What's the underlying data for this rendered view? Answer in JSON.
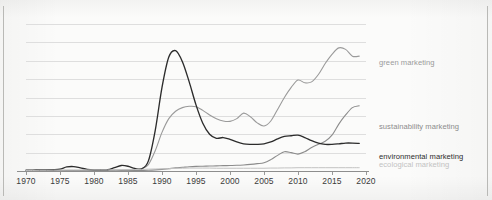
{
  "chart_data": {
    "type": "line",
    "title": "",
    "subtitle": "",
    "xlabel": "",
    "ylabel": "",
    "xlim": [
      1970,
      2020
    ],
    "ylim": [
      0,
      8
    ],
    "grid": true,
    "gridline_count": 8,
    "legend_position": "right-inline",
    "xticks": [
      "1970",
      "1975",
      "1980",
      "1985",
      "1990",
      "1995",
      "2000",
      "2005",
      "2010",
      "2015",
      "2020"
    ],
    "x": [
      1970,
      1971,
      1972,
      1973,
      1974,
      1975,
      1976,
      1977,
      1978,
      1979,
      1980,
      1981,
      1982,
      1983,
      1984,
      1985,
      1986,
      1987,
      1988,
      1989,
      1990,
      1991,
      1992,
      1993,
      1994,
      1995,
      1996,
      1997,
      1998,
      1999,
      2000,
      2001,
      2002,
      2003,
      2004,
      2005,
      2006,
      2007,
      2008,
      2009,
      2010,
      2011,
      2012,
      2013,
      2014,
      2015,
      2016,
      2017,
      2018,
      2019
    ],
    "series": [
      {
        "name": "green marketing",
        "label": "green marketing",
        "color": "#9a9a9a",
        "values": [
          0.02,
          0.02,
          0.02,
          0.02,
          0.02,
          0.02,
          0.03,
          0.03,
          0.03,
          0.03,
          0.03,
          0.04,
          0.04,
          0.05,
          0.05,
          0.06,
          0.08,
          0.12,
          0.35,
          1.1,
          2.1,
          2.85,
          3.25,
          3.45,
          3.52,
          3.5,
          3.3,
          3.05,
          2.85,
          2.72,
          2.7,
          2.85,
          3.15,
          2.95,
          2.62,
          2.45,
          2.72,
          3.35,
          4.0,
          4.55,
          4.95,
          4.8,
          4.85,
          5.25,
          5.85,
          6.35,
          6.7,
          6.62,
          6.25,
          6.25
        ]
      },
      {
        "name": "sustainability marketing",
        "label": "sustainability marketing",
        "color": "#8c8c8c",
        "values": [
          0.01,
          0.01,
          0.01,
          0.01,
          0.01,
          0.01,
          0.01,
          0.01,
          0.01,
          0.01,
          0.01,
          0.01,
          0.01,
          0.01,
          0.02,
          0.02,
          0.02,
          0.03,
          0.04,
          0.06,
          0.09,
          0.13,
          0.17,
          0.2,
          0.23,
          0.25,
          0.26,
          0.27,
          0.28,
          0.29,
          0.3,
          0.31,
          0.33,
          0.36,
          0.4,
          0.45,
          0.62,
          0.85,
          1.05,
          1.0,
          0.92,
          1.05,
          1.28,
          1.45,
          1.62,
          1.95,
          2.55,
          3.05,
          3.45,
          3.55
        ]
      },
      {
        "name": "environmental marketing",
        "label": "environmental marketing",
        "color": "#2c2c2c",
        "values": [
          0.05,
          0.05,
          0.06,
          0.06,
          0.07,
          0.1,
          0.22,
          0.24,
          0.17,
          0.09,
          0.06,
          0.06,
          0.07,
          0.18,
          0.3,
          0.26,
          0.14,
          0.12,
          0.55,
          2.2,
          4.55,
          6.2,
          6.55,
          5.95,
          4.85,
          3.6,
          2.6,
          2.0,
          1.78,
          1.82,
          1.72,
          1.58,
          1.48,
          1.45,
          1.45,
          1.48,
          1.58,
          1.75,
          1.88,
          1.92,
          1.95,
          1.82,
          1.65,
          1.52,
          1.45,
          1.45,
          1.48,
          1.52,
          1.52,
          1.5
        ]
      },
      {
        "name": "ecological marketing",
        "label": "ecological marketing",
        "color": "#c2c2c2",
        "values": [
          0.03,
          0.03,
          0.04,
          0.04,
          0.05,
          0.05,
          0.06,
          0.06,
          0.06,
          0.06,
          0.06,
          0.06,
          0.06,
          0.06,
          0.07,
          0.07,
          0.08,
          0.09,
          0.1,
          0.11,
          0.12,
          0.13,
          0.14,
          0.15,
          0.16,
          0.16,
          0.16,
          0.16,
          0.15,
          0.15,
          0.15,
          0.15,
          0.15,
          0.15,
          0.15,
          0.15,
          0.16,
          0.16,
          0.17,
          0.17,
          0.18,
          0.18,
          0.18,
          0.18,
          0.18,
          0.18,
          0.18,
          0.18,
          0.18,
          0.18
        ]
      }
    ]
  },
  "colors": {
    "background": "#fbfbfa",
    "gridline": "#dedede",
    "axis": "#8e8e8e",
    "tick_text": "#3b3b3b",
    "rule": "#b9b9b6"
  }
}
